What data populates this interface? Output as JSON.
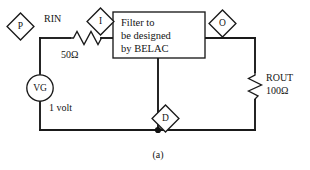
{
  "figure": {
    "caption": "(a)",
    "type": "schematic-circuit-diagram"
  },
  "ports": [
    {
      "id": "p",
      "label": "P",
      "name": "port-p"
    },
    {
      "id": "i",
      "label": "I",
      "name": "port-i"
    },
    {
      "id": "o",
      "label": "O",
      "name": "port-o"
    },
    {
      "id": "d",
      "label": "D",
      "name": "port-d"
    }
  ],
  "components": {
    "source": {
      "symbol_label": "VG",
      "value_label": "1 volt"
    },
    "rin": {
      "ref_label": "RIN",
      "value_label": "50Ω"
    },
    "rout": {
      "ref_label": "ROUT",
      "value_label": "100Ω"
    },
    "filter_block": {
      "line1": "Filter to",
      "line2": "be designed",
      "line3": "by BELAC"
    }
  },
  "colors": {
    "ink": "#1a1a1a",
    "paper": "#ffffff"
  }
}
